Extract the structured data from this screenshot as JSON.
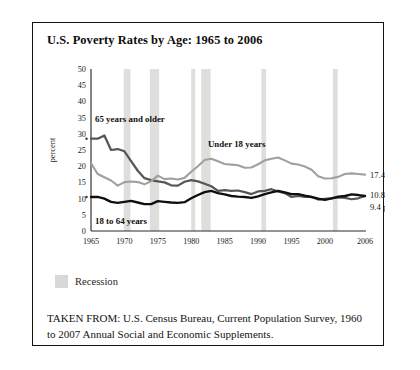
{
  "figure": {
    "title": "U.S. Poverty Rates by Age: 1965 to 2006",
    "source_note": "TAKEN FROM: U.S. Census Bureau, Current Population Survey, 1960 to 2007 Annual Social and Economic Supplements."
  },
  "legend": {
    "recession_label": "Recession",
    "recession_color": "#d8d8d8"
  },
  "annotations": {
    "label_65plus": "65 years and older",
    "label_under18": "Under 18 years",
    "label_18to64": "18 to 64 years",
    "end_under18": "17.4 percent",
    "end_65plus": "10.8 percent",
    "end_18to64": "9.4 percent"
  },
  "chart_data": {
    "type": "line",
    "title": "U.S. Poverty Rates by Age: 1965 to 2006",
    "xlabel": "",
    "ylabel": "percent",
    "xlim": [
      1965,
      2006
    ],
    "ylim": [
      0,
      50
    ],
    "yticks": [
      0,
      5,
      10,
      15,
      20,
      25,
      30,
      35,
      40,
      45,
      50
    ],
    "xticks": [
      1965,
      1970,
      1975,
      1980,
      1985,
      1990,
      1995,
      2000,
      2006
    ],
    "grid": false,
    "legend_position": "inline-annotations",
    "x": [
      1965,
      1966,
      1967,
      1968,
      1969,
      1970,
      1971,
      1972,
      1973,
      1974,
      1975,
      1976,
      1977,
      1978,
      1979,
      1980,
      1981,
      1982,
      1983,
      1984,
      1985,
      1986,
      1987,
      1988,
      1989,
      1990,
      1991,
      1992,
      1993,
      1994,
      1995,
      1996,
      1997,
      1998,
      1999,
      2000,
      2001,
      2002,
      2003,
      2004,
      2005,
      2006
    ],
    "series": [
      {
        "name": "65 years and older",
        "color": "#585653",
        "end_value": 10.8,
        "values": [
          28.5,
          28.5,
          29.5,
          25.0,
          25.3,
          24.6,
          21.6,
          18.6,
          16.3,
          15.7,
          15.3,
          15.0,
          14.1,
          14.0,
          15.2,
          15.7,
          15.3,
          14.6,
          13.8,
          12.4,
          12.6,
          12.4,
          12.5,
          12.0,
          11.4,
          12.2,
          12.4,
          12.9,
          12.2,
          11.7,
          10.5,
          10.8,
          10.5,
          10.5,
          9.7,
          9.9,
          10.1,
          10.4,
          10.2,
          9.8,
          10.1,
          10.8
        ]
      },
      {
        "name": "Under 18 years",
        "color": "#a2a09d",
        "end_value": 17.4,
        "values": [
          21.0,
          17.6,
          16.6,
          15.6,
          14.0,
          15.1,
          15.3,
          15.1,
          14.4,
          15.4,
          17.1,
          16.0,
          16.2,
          15.9,
          16.4,
          18.3,
          20.0,
          21.9,
          22.3,
          21.5,
          20.7,
          20.5,
          20.3,
          19.5,
          19.6,
          20.6,
          21.8,
          22.3,
          22.7,
          21.8,
          20.8,
          20.5,
          19.9,
          18.9,
          16.9,
          16.2,
          16.3,
          16.7,
          17.6,
          17.8,
          17.6,
          17.4
        ]
      },
      {
        "name": "18 to 64 years",
        "color": "#100f0e",
        "end_value": 9.4,
        "values": [
          10.5,
          10.5,
          10.0,
          9.0,
          8.7,
          9.0,
          9.3,
          8.8,
          8.3,
          8.3,
          9.2,
          9.0,
          8.8,
          8.7,
          8.9,
          10.1,
          11.1,
          12.0,
          12.4,
          11.7,
          11.3,
          10.8,
          10.6,
          10.5,
          10.2,
          10.7,
          11.4,
          11.9,
          12.4,
          11.9,
          11.4,
          11.4,
          10.9,
          10.5,
          10.0,
          9.6,
          10.1,
          10.6,
          10.8,
          11.3,
          11.1,
          10.8
        ]
      }
    ],
    "recession_bands": [
      {
        "start": 1969.9,
        "end": 1970.9
      },
      {
        "start": 1973.8,
        "end": 1975.2
      },
      {
        "start": 1980.0,
        "end": 1980.6
      },
      {
        "start": 1981.5,
        "end": 1982.9
      },
      {
        "start": 1990.5,
        "end": 1991.2
      },
      {
        "start": 2001.2,
        "end": 2001.9
      }
    ]
  }
}
